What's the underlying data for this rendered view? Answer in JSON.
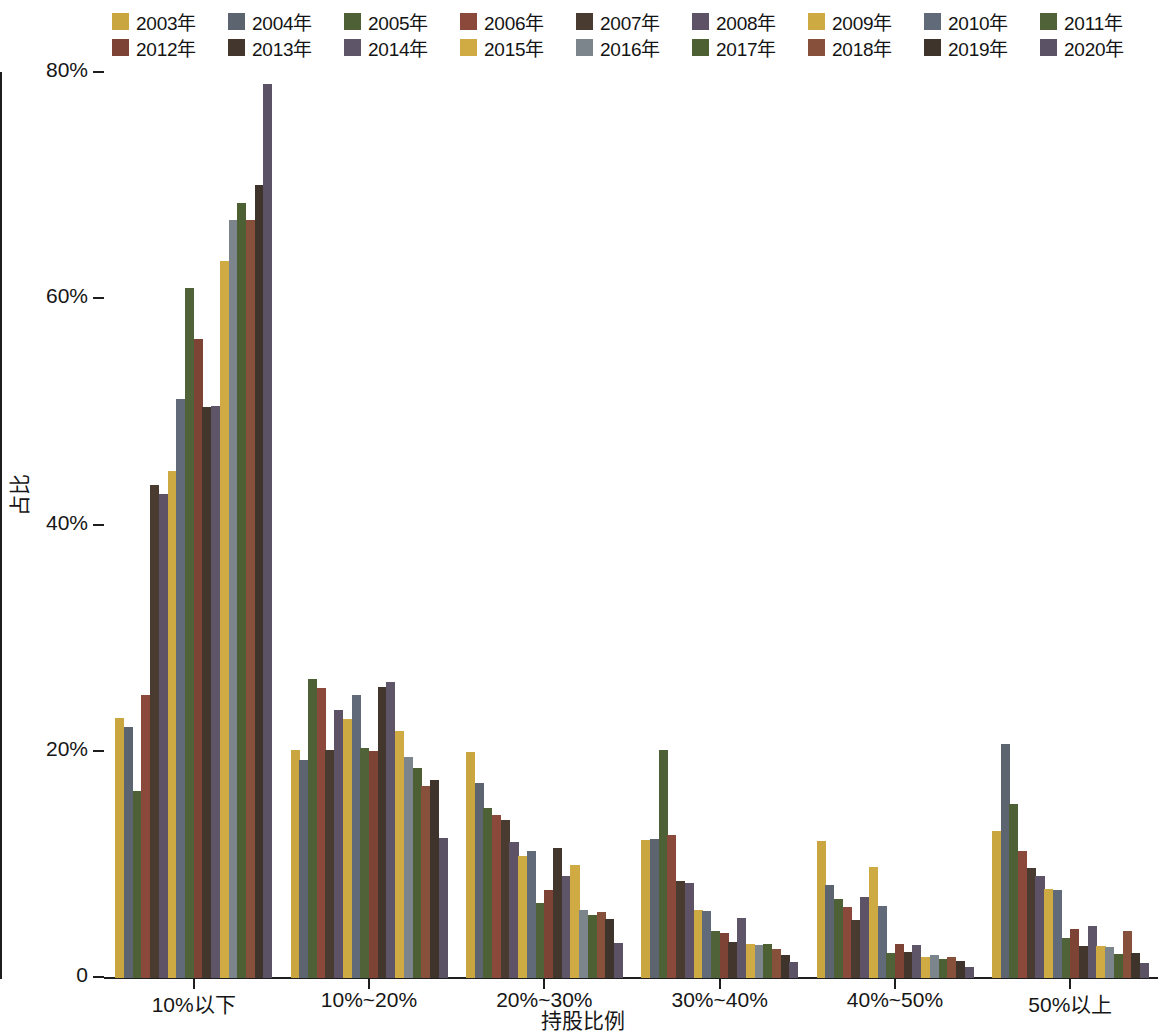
{
  "legend": {
    "items": [
      {
        "label": "2003年",
        "color": "#c9a63f"
      },
      {
        "label": "2004年",
        "color": "#5c6470"
      },
      {
        "label": "2005年",
        "color": "#4e6036"
      },
      {
        "label": "2006年",
        "color": "#8a493a"
      },
      {
        "label": "2007年",
        "color": "#4a3b31"
      },
      {
        "label": "2008年",
        "color": "#5e5266"
      },
      {
        "label": "2009年",
        "color": "#ceaa42"
      },
      {
        "label": "2010年",
        "color": "#606a78"
      },
      {
        "label": "2011年",
        "color": "#4f6238"
      },
      {
        "label": "2012年",
        "color": "#7d4334"
      },
      {
        "label": "2013年",
        "color": "#42362d"
      },
      {
        "label": "2014年",
        "color": "#5f5568"
      },
      {
        "label": "2015年",
        "color": "#d0ab43"
      },
      {
        "label": "2016年",
        "color": "#7c848c"
      },
      {
        "label": "2017年",
        "color": "#4d6034"
      },
      {
        "label": "2018年",
        "color": "#87503b"
      },
      {
        "label": "2019年",
        "color": "#3f342c"
      },
      {
        "label": "2020年",
        "color": "#5c5266"
      }
    ]
  },
  "axes": {
    "y_ticks": [
      "80%",
      "60%",
      "40%",
      "20%",
      "0"
    ],
    "y_title": "占比",
    "x_title": "持股比例"
  },
  "chart_data": {
    "type": "bar",
    "title": "",
    "xlabel": "持股比例",
    "ylabel": "占比",
    "ylim": [
      0,
      80
    ],
    "ytick_values": [
      0,
      20,
      40,
      60,
      80
    ],
    "grid": false,
    "legend_position": "top",
    "categories": [
      "10%以下",
      "10%~20%",
      "20%~30%",
      "30%~40%",
      "40%~50%",
      "50%以上"
    ],
    "series": [
      {
        "name": "2003年",
        "color": "#c9a63f",
        "values": [
          23.0,
          20.2,
          20.0,
          12.2,
          12.1,
          13.0
        ]
      },
      {
        "name": "2004年",
        "color": "#5c6470",
        "values": [
          22.2,
          19.3,
          17.2,
          12.3,
          8.2,
          20.7
        ]
      },
      {
        "name": "2005年",
        "color": "#4e6036",
        "values": [
          16.5,
          26.4,
          15.0,
          20.2,
          7.0,
          15.4
        ]
      },
      {
        "name": "2006年",
        "color": "#8a493a",
        "values": [
          25.0,
          25.6,
          14.4,
          12.6,
          6.3,
          11.2
        ]
      },
      {
        "name": "2007年",
        "color": "#4a3b31",
        "values": [
          43.6,
          20.2,
          14.0,
          8.6,
          5.1,
          9.7
        ]
      },
      {
        "name": "2008年",
        "color": "#5e5266",
        "values": [
          42.8,
          23.7,
          12.0,
          8.4,
          7.2,
          9.0
        ]
      },
      {
        "name": "2009年",
        "color": "#ceaa42",
        "values": [
          44.8,
          22.9,
          10.8,
          6.0,
          9.8,
          7.9
        ]
      },
      {
        "name": "2010年",
        "color": "#606a78",
        "values": [
          51.2,
          25.0,
          11.2,
          5.9,
          6.4,
          7.8
        ]
      },
      {
        "name": "2011年",
        "color": "#4f6238",
        "values": [
          61.0,
          20.3,
          6.6,
          4.2,
          2.2,
          3.5
        ]
      },
      {
        "name": "2012年",
        "color": "#7d4334",
        "values": [
          56.5,
          20.1,
          7.8,
          4.0,
          3.0,
          4.3
        ]
      },
      {
        "name": "2013年",
        "color": "#42362d",
        "values": [
          50.5,
          25.7,
          11.5,
          3.2,
          2.3,
          2.8
        ]
      },
      {
        "name": "2014年",
        "color": "#5f5568",
        "values": [
          50.6,
          26.2,
          9.0,
          5.3,
          2.9,
          4.6
        ]
      },
      {
        "name": "2015年",
        "color": "#d0ab43",
        "values": [
          63.4,
          21.8,
          10.0,
          3.0,
          1.9,
          2.8
        ]
      },
      {
        "name": "2016年",
        "color": "#7c848c",
        "values": [
          67.0,
          19.5,
          6.0,
          2.9,
          2.0,
          2.7
        ]
      },
      {
        "name": "2017年",
        "color": "#4d6034",
        "values": [
          68.5,
          18.6,
          5.6,
          3.0,
          1.7,
          2.1
        ]
      },
      {
        "name": "2018年",
        "color": "#87503b",
        "values": [
          67.0,
          17.0,
          5.8,
          2.6,
          1.9,
          4.2
        ]
      },
      {
        "name": "2019年",
        "color": "#3f342c",
        "values": [
          70.1,
          17.5,
          5.2,
          2.0,
          1.5,
          2.2
        ]
      },
      {
        "name": "2020年",
        "color": "#5c5266",
        "values": [
          79.0,
          12.4,
          3.1,
          1.4,
          1.0,
          1.3
        ]
      }
    ]
  }
}
